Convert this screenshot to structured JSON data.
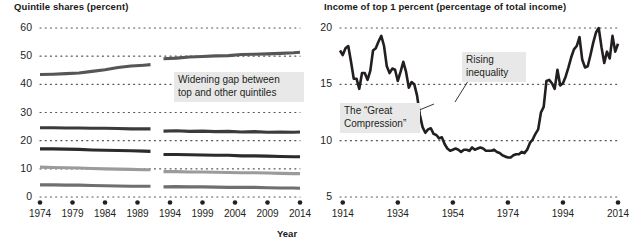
{
  "figure": {
    "background": "#ffffff",
    "ink": "#231f20"
  },
  "panels": {
    "left": {
      "title": "Quintile shares (percent)",
      "axis_label_x": "Year",
      "callout": "Widening gap between\ntop and other quintiles"
    },
    "right": {
      "title": "Income of top 1 percent (percentage of total income)",
      "callout_a": "The “Great\nCompression”",
      "callout_b": "Rising\ninequality"
    }
  },
  "chart_data": [
    {
      "type": "line",
      "title": "Quintile shares (percent)",
      "xlabel": "Year",
      "ylabel": "",
      "xlim": [
        1974,
        2014
      ],
      "ylim": [
        0,
        60
      ],
      "yticks": [
        0,
        10,
        20,
        30,
        40,
        50,
        60
      ],
      "xticks": [
        1974,
        1979,
        1984,
        1989,
        1994,
        1999,
        2004,
        2009,
        2014
      ],
      "grid": "dotted-horizontal",
      "legend": "none",
      "series_break_year": 1992,
      "annotations": [
        {
          "text": "Widening gap between top and other quintiles",
          "x": 1996,
          "y": 39
        }
      ],
      "series": [
        {
          "name": "Top quintile",
          "color": "#565656",
          "x": [
            1974,
            1976,
            1978,
            1980,
            1982,
            1984,
            1986,
            1988,
            1990,
            1991,
            1993,
            1995,
            1997,
            1999,
            2001,
            2003,
            2005,
            2007,
            2009,
            2011,
            2013,
            2014
          ],
          "values": [
            43.5,
            43.6,
            43.8,
            44.0,
            44.6,
            45.2,
            46.0,
            46.5,
            46.8,
            47.0,
            49.1,
            49.3,
            49.7,
            49.9,
            50.1,
            50.2,
            50.6,
            50.7,
            50.8,
            51.0,
            51.2,
            51.4
          ]
        },
        {
          "name": "Fourth quintile",
          "color": "#3b3b3b",
          "x": [
            1974,
            1976,
            1978,
            1980,
            1982,
            1984,
            1986,
            1988,
            1990,
            1991,
            1993,
            1995,
            1997,
            1999,
            2001,
            2003,
            2005,
            2007,
            2009,
            2011,
            2013,
            2014
          ],
          "values": [
            24.6,
            24.6,
            24.5,
            24.5,
            24.4,
            24.4,
            24.3,
            24.2,
            24.2,
            24.2,
            23.4,
            23.5,
            23.3,
            23.4,
            23.2,
            23.3,
            23.1,
            23.2,
            23.0,
            23.1,
            23.0,
            23.1
          ]
        },
        {
          "name": "Third quintile",
          "color": "#2b2b2b",
          "x": [
            1974,
            1976,
            1978,
            1980,
            1982,
            1984,
            1986,
            1988,
            1990,
            1991,
            1993,
            1995,
            1997,
            1999,
            2001,
            2003,
            2005,
            2007,
            2009,
            2011,
            2013,
            2014
          ],
          "values": [
            17.1,
            17.1,
            17.0,
            16.9,
            16.7,
            16.6,
            16.5,
            16.4,
            16.3,
            16.2,
            15.1,
            15.1,
            15.0,
            14.9,
            14.8,
            14.8,
            14.6,
            14.6,
            14.5,
            14.4,
            14.3,
            14.3
          ]
        },
        {
          "name": "Second quintile",
          "color": "#9b9b9b",
          "x": [
            1974,
            1976,
            1978,
            1980,
            1982,
            1984,
            1986,
            1988,
            1990,
            1991,
            1993,
            1995,
            1997,
            1999,
            2001,
            2003,
            2005,
            2007,
            2009,
            2011,
            2013,
            2014
          ],
          "values": [
            10.6,
            10.5,
            10.4,
            10.3,
            10.1,
            10.0,
            9.9,
            9.8,
            9.7,
            9.7,
            9.0,
            9.0,
            8.9,
            8.9,
            8.8,
            8.7,
            8.6,
            8.6,
            8.5,
            8.4,
            8.3,
            8.3
          ]
        },
        {
          "name": "Bottom quintile",
          "color": "#6f6f6f",
          "x": [
            1974,
            1976,
            1978,
            1980,
            1982,
            1984,
            1986,
            1988,
            1990,
            1991,
            1993,
            1995,
            1997,
            1999,
            2001,
            2003,
            2005,
            2007,
            2009,
            2011,
            2013,
            2014
          ],
          "values": [
            4.3,
            4.3,
            4.2,
            4.2,
            4.1,
            4.0,
            3.9,
            3.8,
            3.8,
            3.8,
            3.6,
            3.7,
            3.6,
            3.6,
            3.5,
            3.4,
            3.4,
            3.4,
            3.3,
            3.2,
            3.2,
            3.1
          ]
        }
      ]
    },
    {
      "type": "line",
      "title": "Income of top 1 percent (percentage of total income)",
      "xlabel": "",
      "ylabel": "",
      "xlim": [
        1913,
        2014
      ],
      "ylim": [
        5,
        20
      ],
      "yticks": [
        5,
        10,
        15,
        20
      ],
      "xticks": [
        1914,
        1934,
        1954,
        1974,
        1994,
        2014
      ],
      "grid": "dotted-horizontal",
      "legend": "none",
      "annotations": [
        {
          "text": "The “Great Compression”",
          "x": 1930,
          "y": 12.3
        },
        {
          "text": "Rising inequality",
          "x": 1976,
          "y": 17.2
        }
      ],
      "series": [
        {
          "name": "Top 1 percent income share",
          "color": "#231f20",
          "x": [
            1913,
            1914,
            1915,
            1916,
            1917,
            1918,
            1919,
            1920,
            1921,
            1922,
            1923,
            1924,
            1925,
            1926,
            1927,
            1928,
            1929,
            1930,
            1931,
            1932,
            1933,
            1934,
            1935,
            1936,
            1937,
            1938,
            1939,
            1940,
            1941,
            1942,
            1943,
            1944,
            1945,
            1946,
            1947,
            1948,
            1949,
            1950,
            1951,
            1952,
            1953,
            1954,
            1955,
            1956,
            1957,
            1958,
            1959,
            1960,
            1961,
            1962,
            1963,
            1964,
            1965,
            1966,
            1967,
            1968,
            1969,
            1970,
            1971,
            1972,
            1973,
            1974,
            1975,
            1976,
            1977,
            1978,
            1979,
            1980,
            1981,
            1982,
            1983,
            1984,
            1985,
            1986,
            1987,
            1988,
            1989,
            1990,
            1991,
            1992,
            1993,
            1994,
            1995,
            1996,
            1997,
            1998,
            1999,
            2000,
            2001,
            2002,
            2003,
            2004,
            2005,
            2006,
            2007,
            2008,
            2009,
            2010,
            2011,
            2012,
            2013,
            2014
          ],
          "values": [
            18.0,
            17.6,
            18.2,
            18.4,
            17.0,
            15.5,
            15.5,
            14.6,
            16.0,
            16.0,
            15.4,
            16.2,
            18.0,
            18.2,
            18.8,
            19.3,
            18.4,
            16.6,
            16.0,
            16.4,
            16.3,
            15.3,
            16.1,
            17.0,
            16.1,
            14.7,
            15.2,
            15.0,
            14.0,
            12.3,
            11.2,
            10.7,
            11.0,
            11.1,
            10.6,
            10.5,
            10.2,
            10.3,
            9.7,
            9.3,
            9.1,
            9.2,
            9.3,
            9.2,
            9.0,
            9.2,
            9.2,
            9.1,
            9.4,
            9.2,
            9.3,
            9.4,
            9.3,
            9.1,
            9.1,
            9.1,
            9.2,
            9.0,
            8.9,
            8.7,
            8.6,
            8.5,
            8.5,
            8.7,
            8.8,
            8.8,
            9.0,
            8.9,
            9.2,
            9.8,
            10.1,
            10.6,
            11.0,
            12.5,
            13.0,
            15.3,
            15.4,
            15.1,
            14.6,
            16.3,
            14.9,
            15.1,
            15.7,
            16.5,
            17.4,
            18.1,
            18.4,
            19.2,
            17.2,
            16.5,
            16.6,
            17.6,
            18.7,
            19.6,
            20.0,
            18.3,
            16.9,
            17.9,
            17.3,
            19.3,
            17.9,
            18.6
          ]
        }
      ]
    }
  ]
}
